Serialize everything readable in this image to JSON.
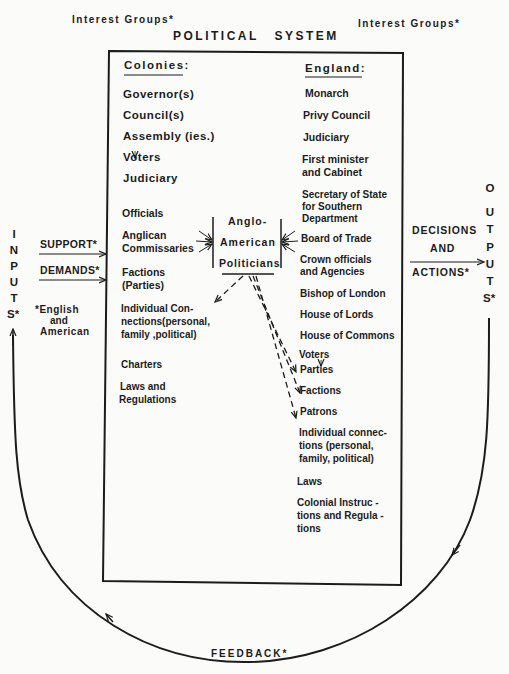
{
  "diagram": {
    "title": "POLITICAL SYSTEM",
    "interest_groups_left": "Interest Groups*",
    "interest_groups_right": "Interest Groups*",
    "colonies": {
      "heading": "Colonies:",
      "items": [
        "Governor(s)",
        "Council(s)",
        "Assembly (ies.)",
        "Voters",
        "Judiciary",
        "Officials",
        "Anglican",
        "Commissaries",
        "Factions",
        "(Parties)",
        "Individual Con-",
        "nections(personal,",
        "family ,political)",
        "Charters",
        "Laws and",
        "Regulations"
      ]
    },
    "england": {
      "heading": "England:",
      "items": [
        "Monarch",
        "Privy Council",
        "Judiciary",
        "First minister",
        "and Cabinet",
        "Secretary of State",
        "for Southern",
        "Department",
        "Board of Trade",
        "Crown officials",
        "and Agencies",
        "Bishop of London",
        "House of Lords",
        "House of Commons",
        "Voters",
        "Parties",
        "Factions",
        "Patrons",
        "Individual connec-",
        "tions (personal,",
        "family, political)",
        "Laws",
        "Colonial Instruc -",
        "tions and Regula -",
        "tions"
      ]
    },
    "center": [
      "Anglo-",
      "American",
      "Politicians"
    ],
    "inputs": {
      "label_letters": [
        "I",
        "N",
        "P",
        "U",
        "T",
        "S*"
      ],
      "support": "SUPPORT*",
      "demands": "DEMANDS*",
      "note_line1": "*English",
      "note_line2": "and",
      "note_line3": "American"
    },
    "outputs": {
      "label_letters": [
        "O",
        "U",
        "T",
        "P",
        "U",
        "T",
        "S*"
      ],
      "decisions": "DECISIONS",
      "and": "AND",
      "actions": "ACTIONS*"
    },
    "feedback": "FEEDBACK*"
  }
}
